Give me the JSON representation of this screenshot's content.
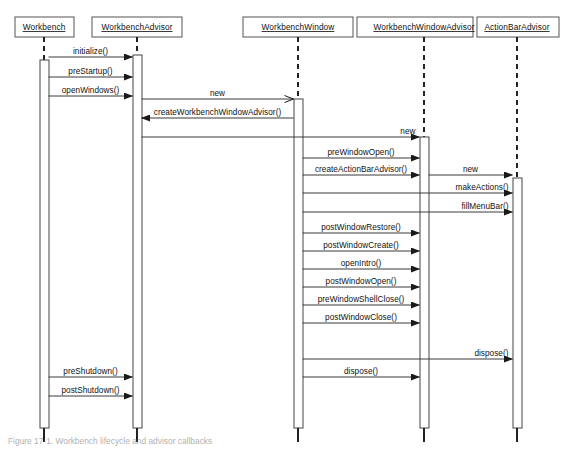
{
  "figure": {
    "caption": "Figure 17-1. Workbench lifecycle and advisor callbacks",
    "background": "#ffffff",
    "line_color": "#3a3a3a"
  },
  "chart_data": {
    "type": "diagram",
    "diagram_kind": "uml-sequence",
    "title": "Workbench lifecycle and advisor callbacks",
    "canvas": {
      "width": 574,
      "height": 454
    },
    "lifelines": [
      {
        "id": "workbench",
        "label": "Workbench",
        "x": 44,
        "box_x": 15,
        "box_y": 17,
        "box_w": 59,
        "box_h": 20,
        "activation": {
          "x": 40,
          "y": 60,
          "w": 9,
          "h": 368
        },
        "foot_y": 438
      },
      {
        "id": "workbench_advisor",
        "label": "WorkbenchAdvisor",
        "x": 137,
        "box_x": 92,
        "box_y": 17,
        "box_w": 90,
        "box_h": 20,
        "activation": {
          "x": 133,
          "y": 55,
          "w": 9,
          "h": 373
        },
        "foot_y": 438
      },
      {
        "id": "workbench_window",
        "label": "WorkbenchWindow",
        "x": 298,
        "box_x": 243,
        "box_y": 17,
        "box_w": 110,
        "box_h": 20,
        "activation": {
          "x": 294,
          "y": 99,
          "w": 9,
          "h": 329
        },
        "foot_y": 438
      },
      {
        "id": "workbench_window_advisor",
        "label": "WorkbenchWindowAdvisor",
        "x": 424,
        "box_x": 357,
        "box_y": 17,
        "box_w": 116,
        "box_h": 20,
        "activation": {
          "x": 420,
          "y": 137,
          "w": 9,
          "h": 291
        },
        "foot_y": 438
      },
      {
        "id": "action_bar_advisor",
        "label": "ActionBarAdvisor",
        "x": 517,
        "box_x": 477,
        "box_y": 17,
        "box_w": 82,
        "box_h": 20,
        "activation": {
          "x": 513,
          "y": 178,
          "w": 9,
          "h": 250
        },
        "foot_y": 438
      }
    ],
    "messages": [
      {
        "label": "initialize()",
        "from": "workbench",
        "to": "workbench_advisor",
        "y": 57,
        "arrow": "filled",
        "label_align": "center"
      },
      {
        "label": "preStartup()",
        "from": "workbench",
        "to": "workbench_advisor",
        "y": 77,
        "arrow": "filled",
        "label_align": "center"
      },
      {
        "label": "openWindows()",
        "from": "workbench",
        "to": "workbench_advisor",
        "y": 96,
        "arrow": "filled",
        "label_align": "center"
      },
      {
        "label": "new",
        "from": "workbench_advisor",
        "to": "workbench_window",
        "y": 99,
        "arrow": "open",
        "label_align": "center"
      },
      {
        "label": "createWorkbenchWindowAdvisor()",
        "from": "workbench_window",
        "to": "workbench_advisor",
        "y": 118,
        "arrow": "filled",
        "label_align": "center"
      },
      {
        "label": "new",
        "from": "workbench_advisor",
        "to": "workbench_window_advisor",
        "y": 137,
        "arrow": "filled",
        "label_align": "right"
      },
      {
        "label": "preWindowOpen()",
        "from": "workbench_window",
        "to": "workbench_window_advisor",
        "y": 158,
        "arrow": "filled",
        "label_align": "center"
      },
      {
        "label": "createActionBarAdvisor()",
        "from": "workbench_window",
        "to": "workbench_window_advisor",
        "y": 175,
        "arrow": "filled",
        "label_align": "center"
      },
      {
        "label": "new",
        "from": "workbench_window_advisor",
        "to": "action_bar_advisor",
        "y": 175,
        "arrow": "filled",
        "label_align": "center"
      },
      {
        "label": "makeActions()",
        "from": "workbench_window",
        "to": "action_bar_advisor",
        "y": 193,
        "arrow": "filled",
        "label_align": "right"
      },
      {
        "label": "fillMenuBar()",
        "from": "workbench_window",
        "to": "action_bar_advisor",
        "y": 212,
        "arrow": "filled",
        "label_align": "right"
      },
      {
        "label": "postWindowRestore()",
        "from": "workbench_window",
        "to": "workbench_window_advisor",
        "y": 233,
        "arrow": "filled",
        "label_align": "center"
      },
      {
        "label": "postWindowCreate()",
        "from": "workbench_window",
        "to": "workbench_window_advisor",
        "y": 251,
        "arrow": "filled",
        "label_align": "center"
      },
      {
        "label": "openIntro()",
        "from": "workbench_window",
        "to": "workbench_window_advisor",
        "y": 269,
        "arrow": "filled",
        "label_align": "center"
      },
      {
        "label": "postWindowOpen()",
        "from": "workbench_window",
        "to": "workbench_window_advisor",
        "y": 287,
        "arrow": "filled",
        "label_align": "center"
      },
      {
        "label": "preWindowShellClose()",
        "from": "workbench_window",
        "to": "workbench_window_advisor",
        "y": 305,
        "arrow": "filled",
        "label_align": "center"
      },
      {
        "label": "postWindowClose()",
        "from": "workbench_window",
        "to": "workbench_window_advisor",
        "y": 323,
        "arrow": "filled",
        "label_align": "center"
      },
      {
        "label": "dispose()",
        "from": "workbench_window",
        "to": "action_bar_advisor",
        "y": 359,
        "arrow": "filled",
        "label_align": "right"
      },
      {
        "label": "preShutdown()",
        "from": "workbench",
        "to": "workbench_advisor",
        "y": 377,
        "arrow": "filled",
        "label_align": "center"
      },
      {
        "label": "dispose()",
        "from": "workbench_window",
        "to": "workbench_window_advisor",
        "y": 377,
        "arrow": "filled",
        "label_align": "center"
      },
      {
        "label": "postShutdown()",
        "from": "workbench",
        "to": "workbench_advisor",
        "y": 396,
        "arrow": "filled",
        "label_align": "center"
      }
    ]
  }
}
